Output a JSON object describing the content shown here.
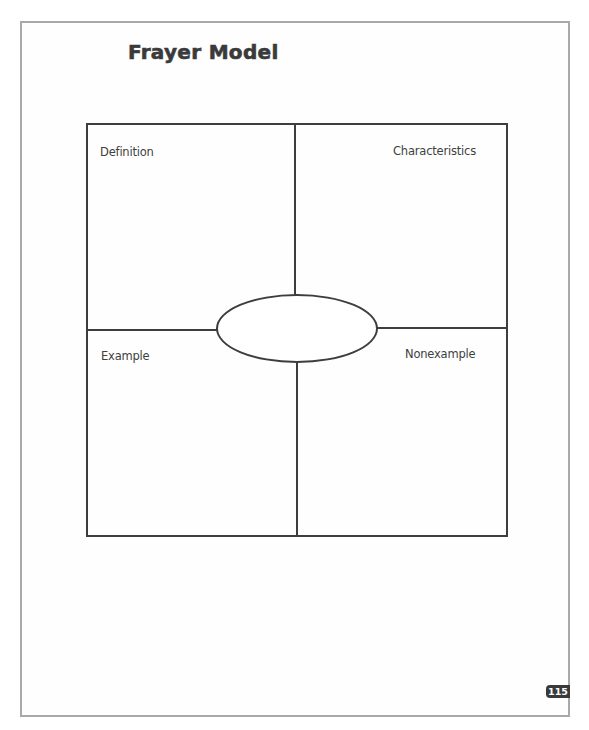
{
  "page": {
    "title": "Frayer Model",
    "page_number": "115"
  },
  "frayer": {
    "quadrants": [
      {
        "position": "top-left",
        "label": "Definition"
      },
      {
        "position": "top-right",
        "label": "Characteristics"
      },
      {
        "position": "bottom-left",
        "label": "Example"
      },
      {
        "position": "bottom-right",
        "label": "Nonexample"
      }
    ],
    "center_term": ""
  },
  "colors": {
    "line": "#3d3d3d",
    "text": "#3f3f3f",
    "page_border": "#a9a9a9",
    "badge_bg": "#3a3a3a"
  }
}
